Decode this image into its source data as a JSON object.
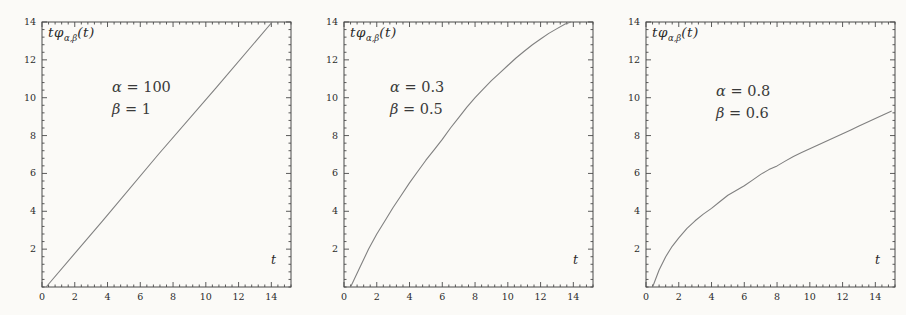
{
  "page": {
    "background": "#fbfaf7",
    "text_color": "#2b2b2b"
  },
  "figures": [
    {
      "axis_label": {
        "pre": "tφ",
        "sub": "α,β",
        "post": "(t)"
      },
      "annotation": {
        "alpha_sym": "α",
        "alpha_val": "= 100",
        "beta_sym": "β",
        "beta_val": "= 1"
      },
      "x_axis_label": "t"
    },
    {
      "axis_label": {
        "pre": "tφ",
        "sub": "α,β",
        "post": "(t)"
      },
      "annotation": {
        "alpha_sym": "α",
        "alpha_val": "= 0.3",
        "beta_sym": "β",
        "beta_val": "= 0.5"
      },
      "x_axis_label": "t"
    },
    {
      "axis_label": {
        "pre": "tφ",
        "sub": "α,β",
        "post": "(t)"
      },
      "annotation": {
        "alpha_sym": "α",
        "alpha_val": "= 0.8",
        "beta_sym": "β",
        "beta_val": "= 0.6"
      },
      "x_axis_label": "t"
    }
  ],
  "chart_data": [
    {
      "type": "line",
      "title": "tφα,β(t) for α = 100, β = 1",
      "xlabel": "t",
      "ylabel": "tφα,β(t)",
      "params": {
        "alpha": 100,
        "beta": 1
      },
      "xlim": [
        0,
        15.2
      ],
      "ylim": [
        0,
        14
      ],
      "xticks": [
        0,
        2,
        4,
        6,
        8,
        10,
        12,
        14
      ],
      "yticks": [
        2,
        4,
        6,
        8,
        10,
        12,
        14
      ],
      "minor_tick_step": 0.4,
      "frame": true,
      "grid": false,
      "line_color": "#808080",
      "frame_color": "#4a4a4a",
      "label_color": "#2b2b2b",
      "points": [
        [
          0.25,
          0
        ],
        [
          3.7,
          3.5
        ],
        [
          7.1,
          7.0
        ],
        [
          10.6,
          10.5
        ],
        [
          14.05,
          14
        ]
      ]
    },
    {
      "type": "line",
      "title": "tφα,β(t) for α = 0.3, β = 0.5",
      "xlabel": "t",
      "ylabel": "tφα,β(t)",
      "params": {
        "alpha": 0.3,
        "beta": 0.5
      },
      "xlim": [
        0,
        15.2
      ],
      "ylim": [
        0,
        14
      ],
      "xticks": [
        0,
        2,
        4,
        6,
        8,
        10,
        12,
        14
      ],
      "yticks": [
        2,
        4,
        6,
        8,
        10,
        12,
        14
      ],
      "minor_tick_step": 0.4,
      "frame": true,
      "grid": false,
      "line_color": "#808080",
      "frame_color": "#4a4a4a",
      "label_color": "#2b2b2b",
      "points": [
        [
          0.4,
          0
        ],
        [
          1,
          1.1
        ],
        [
          1.5,
          2.0
        ],
        [
          2,
          2.8
        ],
        [
          2.5,
          3.5
        ],
        [
          3,
          4.2
        ],
        [
          3.5,
          4.85
        ],
        [
          4,
          5.5
        ],
        [
          4.5,
          6.1
        ],
        [
          5,
          6.7
        ],
        [
          5.5,
          7.25
        ],
        [
          6,
          7.8
        ],
        [
          6.5,
          8.4
        ],
        [
          7,
          8.95
        ],
        [
          7.5,
          9.5
        ],
        [
          8,
          10.0
        ],
        [
          8.5,
          10.45
        ],
        [
          9,
          10.9
        ],
        [
          9.5,
          11.3
        ],
        [
          10,
          11.7
        ],
        [
          10.5,
          12.1
        ],
        [
          11,
          12.45
        ],
        [
          11.5,
          12.8
        ],
        [
          12,
          13.1
        ],
        [
          12.5,
          13.4
        ],
        [
          13,
          13.65
        ],
        [
          13.5,
          13.9
        ],
        [
          13.85,
          14
        ]
      ]
    },
    {
      "type": "line",
      "title": "tφα,β(t) for α = 0.8, β = 0.6",
      "xlabel": "t",
      "ylabel": "tφα,β(t)",
      "params": {
        "alpha": 0.8,
        "beta": 0.6
      },
      "xlim": [
        0,
        15.2
      ],
      "ylim": [
        0,
        14
      ],
      "xticks": [
        0,
        2,
        4,
        6,
        8,
        10,
        12,
        14
      ],
      "yticks": [
        2,
        4,
        6,
        8,
        10,
        12,
        14
      ],
      "minor_tick_step": 0.4,
      "frame": true,
      "grid": false,
      "line_color": "#808080",
      "frame_color": "#4a4a4a",
      "label_color": "#2b2b2b",
      "points": [
        [
          0.4,
          0
        ],
        [
          0.8,
          0.9
        ],
        [
          1.2,
          1.6
        ],
        [
          1.6,
          2.15
        ],
        [
          2,
          2.6
        ],
        [
          2.5,
          3.1
        ],
        [
          3,
          3.5
        ],
        [
          3.5,
          3.85
        ],
        [
          4,
          4.15
        ],
        [
          4.5,
          4.5
        ],
        [
          5,
          4.85
        ],
        [
          5.5,
          5.1
        ],
        [
          6,
          5.35
        ],
        [
          6.5,
          5.65
        ],
        [
          7,
          5.95
        ],
        [
          7.5,
          6.2
        ],
        [
          8,
          6.4
        ],
        [
          8.5,
          6.65
        ],
        [
          9,
          6.9
        ],
        [
          9.5,
          7.1
        ],
        [
          10,
          7.3
        ],
        [
          10.5,
          7.5
        ],
        [
          11,
          7.7
        ],
        [
          11.5,
          7.9
        ],
        [
          12,
          8.1
        ],
        [
          12.5,
          8.3
        ],
        [
          13,
          8.5
        ],
        [
          13.5,
          8.7
        ],
        [
          14,
          8.9
        ],
        [
          14.5,
          9.1
        ],
        [
          15,
          9.3
        ]
      ]
    }
  ]
}
